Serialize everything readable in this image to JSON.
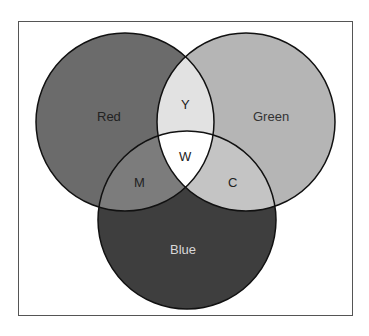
{
  "diagram": {
    "type": "venn",
    "sets": [
      {
        "label": "Red",
        "fill": "#6b6b6b",
        "label_color": "#222222"
      },
      {
        "label": "Green",
        "fill": "#b5b5b5",
        "label_color": "#333333"
      },
      {
        "label": "Blue",
        "fill": "#3e3e3e",
        "label_color": "#d8d8d8"
      }
    ],
    "intersections": [
      {
        "sets": [
          "Red",
          "Green"
        ],
        "label": "Y",
        "fill": "#e2e2e2"
      },
      {
        "sets": [
          "Red",
          "Blue"
        ],
        "label": "M",
        "fill": "#7c7c7c"
      },
      {
        "sets": [
          "Green",
          "Blue"
        ],
        "label": "C",
        "fill": "#c4c4c4"
      },
      {
        "sets": [
          "Red",
          "Green",
          "Blue"
        ],
        "label": "W",
        "fill": "#ffffff"
      }
    ]
  }
}
